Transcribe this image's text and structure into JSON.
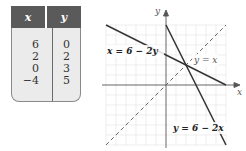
{
  "table": {
    "headers": [
      "x",
      "y"
    ],
    "rows": [
      [
        "6",
        "0"
      ],
      [
        "2",
        "2"
      ],
      [
        "0",
        "3"
      ],
      [
        "−4",
        "5"
      ]
    ]
  },
  "graph": {
    "axis_labels": {
      "x": "x",
      "y": "y"
    },
    "lines": [
      {
        "name": "x = 6 − 2y",
        "label": "x = 6 − 2y",
        "style": "solid",
        "from": [
          -6,
          6
        ],
        "to": [
          6,
          0
        ]
      },
      {
        "name": "y = 6 − 2x",
        "label": "y = 6 − 2x",
        "style": "solid",
        "from": [
          0,
          6
        ],
        "to": [
          6,
          -6
        ]
      },
      {
        "name": "y = x",
        "label": "y = x",
        "style": "dashed",
        "from": [
          -6,
          -6
        ],
        "to": [
          6,
          6
        ]
      }
    ],
    "intersection": [
      2,
      2
    ],
    "grid": {
      "xmin": -6,
      "xmax": 6,
      "ymin": -6,
      "ymax": 6,
      "unit": 1
    },
    "colors": {
      "solid_line": "#333333",
      "dashed_line": "#666666",
      "grid": "#e2e2e2",
      "axis": "#555555"
    }
  }
}
